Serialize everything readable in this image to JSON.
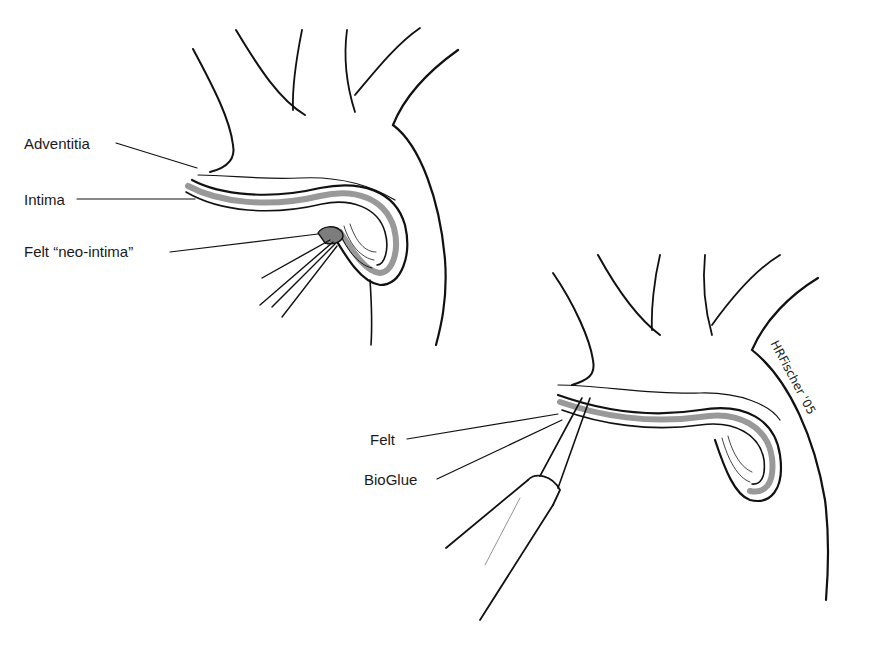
{
  "figure": {
    "panel_left": {
      "labels": [
        "Adventitia",
        "Intima",
        "Felt “neo-intima”"
      ]
    },
    "panel_right": {
      "labels": [
        "Felt",
        "BioGlue"
      ]
    },
    "signature": "HRFischer '05",
    "colors": {
      "line": "#111111",
      "layer_fill": "#9a9a9a",
      "felt_fill": "#7d7d7d",
      "background": "#ffffff"
    }
  }
}
